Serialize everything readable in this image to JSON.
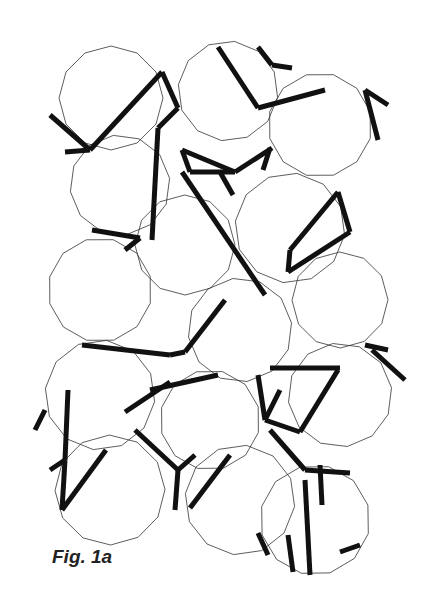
{
  "caption": "Fig. 1a",
  "colors": {
    "background": "#ffffff",
    "thin_line": "#333333",
    "thick_line": "#111111"
  },
  "tiles": [
    {
      "cx": 111,
      "cy": 98,
      "r": 52
    },
    {
      "cx": 228,
      "cy": 91,
      "r": 50
    },
    {
      "cx": 320,
      "cy": 125,
      "r": 52
    },
    {
      "cx": 120,
      "cy": 185,
      "r": 50
    },
    {
      "cx": 185,
      "cy": 245,
      "r": 50
    },
    {
      "cx": 290,
      "cy": 228,
      "r": 55
    },
    {
      "cx": 100,
      "cy": 290,
      "r": 52
    },
    {
      "cx": 240,
      "cy": 330,
      "r": 52
    },
    {
      "cx": 340,
      "cy": 300,
      "r": 48
    },
    {
      "cx": 100,
      "cy": 395,
      "r": 55
    },
    {
      "cx": 210,
      "cy": 420,
      "r": 50
    },
    {
      "cx": 340,
      "cy": 395,
      "r": 52
    },
    {
      "cx": 110,
      "cy": 490,
      "r": 55
    },
    {
      "cx": 240,
      "cy": 500,
      "r": 55
    },
    {
      "cx": 315,
      "cy": 520,
      "r": 55
    }
  ],
  "thick_lines": [
    [
      50,
      115,
      90,
      150
    ],
    [
      65,
      152,
      90,
      150
    ],
    [
      90,
      150,
      162,
      72
    ],
    [
      162,
      72,
      178,
      108
    ],
    [
      158,
      128,
      178,
      108
    ],
    [
      218,
      47,
      258,
      108
    ],
    [
      258,
      47,
      272,
      65
    ],
    [
      272,
      65,
      292,
      68
    ],
    [
      258,
      108,
      325,
      90
    ],
    [
      365,
      90,
      378,
      140
    ],
    [
      365,
      90,
      388,
      105
    ],
    [
      158,
      128,
      152,
      240
    ],
    [
      92,
      230,
      140,
      238
    ],
    [
      125,
      250,
      140,
      238
    ],
    [
      182,
      150,
      190,
      172
    ],
    [
      182,
      150,
      235,
      172
    ],
    [
      235,
      172,
      272,
      148
    ],
    [
      270,
      148,
      263,
      170
    ],
    [
      190,
      172,
      235,
      172
    ],
    [
      182,
      172,
      265,
      295
    ],
    [
      220,
      172,
      233,
      195
    ],
    [
      338,
      192,
      350,
      232
    ],
    [
      338,
      192,
      290,
      250
    ],
    [
      290,
      250,
      288,
      272
    ],
    [
      288,
      272,
      350,
      232
    ],
    [
      125,
      412,
      170,
      382
    ],
    [
      82,
      345,
      170,
      355
    ],
    [
      170,
      355,
      185,
      352
    ],
    [
      185,
      352,
      225,
      300
    ],
    [
      150,
      390,
      218,
      375
    ],
    [
      258,
      375,
      265,
      420
    ],
    [
      265,
      420,
      300,
      432
    ],
    [
      265,
      420,
      280,
      390
    ],
    [
      300,
      432,
      338,
      370
    ],
    [
      270,
      368,
      340,
      368
    ],
    [
      365,
      345,
      388,
      350
    ],
    [
      372,
      350,
      405,
      380
    ],
    [
      45,
      410,
      35,
      430
    ],
    [
      68,
      390,
      65,
      460
    ],
    [
      50,
      470,
      65,
      460
    ],
    [
      65,
      460,
      62,
      510
    ],
    [
      62,
      510,
      106,
      450
    ],
    [
      135,
      430,
      178,
      470
    ],
    [
      178,
      470,
      195,
      455
    ],
    [
      178,
      470,
      175,
      510
    ],
    [
      190,
      508,
      230,
      455
    ],
    [
      270,
      430,
      305,
      470
    ],
    [
      305,
      470,
      350,
      473
    ],
    [
      320,
      465,
      322,
      505
    ],
    [
      288,
      535,
      293,
      572
    ],
    [
      258,
      533,
      268,
      555
    ],
    [
      305,
      480,
      310,
      575
    ],
    [
      340,
      552,
      360,
      545
    ]
  ]
}
